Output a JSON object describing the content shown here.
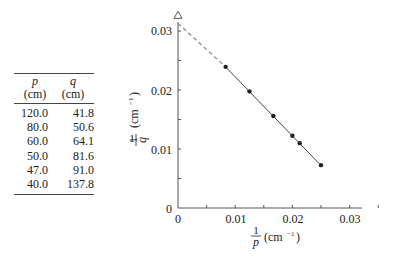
{
  "table": {
    "headers": [
      {
        "var": "p",
        "unit": "(cm)"
      },
      {
        "var": "q",
        "unit": "(cm)"
      }
    ],
    "rows": [
      [
        "120.0",
        "41.8"
      ],
      [
        "80.0",
        "50.6"
      ],
      [
        "60.0",
        "64.1"
      ],
      [
        "50.0",
        "81.6"
      ],
      [
        "47.0",
        "91.0"
      ],
      [
        "40.0",
        "137.8"
      ]
    ]
  },
  "chart_data": {
    "type": "scatter",
    "title": "",
    "xlabel": "1/p (cm^-1)",
    "ylabel": "1/q (cm^-1)",
    "xlim": [
      0,
      0.035
    ],
    "ylim": [
      0,
      0.032
    ],
    "x_ticks": [
      "0",
      "0.01",
      "0.02",
      "0.03"
    ],
    "y_ticks": [
      "0",
      "0.01",
      "0.02",
      "0.03"
    ],
    "grid": false,
    "series": [
      {
        "name": "measured",
        "x": [
          0.00833,
          0.0125,
          0.01667,
          0.02,
          0.02128,
          0.025
        ],
        "y": [
          0.02392,
          0.01976,
          0.0156,
          0.01225,
          0.01099,
          0.00726
        ]
      }
    ],
    "fit_line": {
      "x": [
        0.00833,
        0.025
      ],
      "y": [
        0.0239,
        0.0072
      ],
      "style": "solid"
    },
    "extrapolation": {
      "x": [
        0,
        0.00833
      ],
      "y": [
        0.0313,
        0.0239
      ],
      "style": "dashed"
    },
    "annotations": [
      {
        "type": "triangle-marker",
        "x": 0,
        "y": 0.0313
      }
    ]
  },
  "labels": {
    "x_num": "1",
    "x_den": "p",
    "x_unit": "(cm",
    "x_exp": "−1",
    "x_close": ")",
    "y_num": "1",
    "y_den": "q",
    "y_unit": "(cm",
    "y_exp": "−1",
    "y_close": ")",
    "tick0x": "0",
    "tick1x": "0.01",
    "tick2x": "0.02",
    "tick3x": "0.03",
    "tick0y": "0",
    "tick1y": "0.01",
    "tick2y": "0.02",
    "tick3y": "0.03"
  }
}
